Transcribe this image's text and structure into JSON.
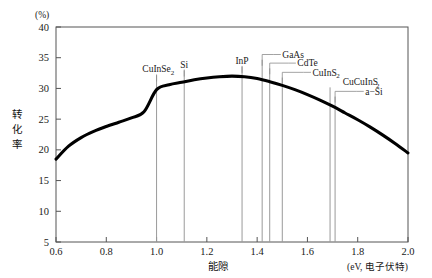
{
  "figure": {
    "y_unit_label": "(%)",
    "x_axis_title": "能隙",
    "x_unit_label": "(eV, 电子伏特)",
    "y_axis_title_chars": [
      "转",
      "化",
      "率"
    ],
    "caption": ""
  },
  "chart_data": {
    "type": "line",
    "title": "",
    "xlabel": "能隙",
    "ylabel": "转化率",
    "x_unit": "(eV, 电子伏特)",
    "y_unit": "(%)",
    "xlim": [
      0.6,
      2.0
    ],
    "ylim": [
      5,
      40
    ],
    "grid": false,
    "legend": "none",
    "x_ticks": [
      "0.6",
      "0.8",
      "1.0",
      "1.2",
      "1.4",
      "1.6",
      "1.8",
      "2.0"
    ],
    "x_tick_values": [
      0.6,
      0.8,
      1.0,
      1.2,
      1.4,
      1.6,
      1.8,
      2.0
    ],
    "y_ticks": [
      "5",
      "10",
      "15",
      "20",
      "25",
      "30",
      "35",
      "40"
    ],
    "y_tick_values": [
      5,
      10,
      15,
      20,
      25,
      30,
      35,
      40
    ],
    "series": [
      {
        "name": "理论转化率上限",
        "x": [
          0.6,
          0.65,
          0.7,
          0.75,
          0.8,
          0.85,
          0.9,
          0.95,
          1.0,
          1.05,
          1.1,
          1.15,
          1.2,
          1.25,
          1.3,
          1.35,
          1.4,
          1.45,
          1.5,
          1.55,
          1.6,
          1.65,
          1.7,
          1.75,
          1.8,
          1.85,
          1.9,
          1.95,
          2.0
        ],
        "y": [
          18.5,
          20.6,
          22.0,
          23.0,
          23.8,
          24.5,
          25.2,
          26.2,
          29.8,
          30.6,
          31.0,
          31.4,
          31.7,
          31.9,
          32.0,
          31.9,
          31.6,
          31.1,
          30.5,
          29.8,
          29.0,
          28.1,
          27.1,
          26.0,
          24.9,
          23.7,
          22.4,
          21.0,
          19.5
        ]
      }
    ],
    "markers": [
      {
        "id": "cuinse2",
        "label": "CuInSe",
        "sub": "2",
        "x": 1.0,
        "label_x": 1.0,
        "label_y": 32.6,
        "leader": "vertical"
      },
      {
        "id": "si",
        "label": "Si",
        "sub": "",
        "x": 1.11,
        "label_x": 1.11,
        "label_y": 33.4,
        "leader": "vertical"
      },
      {
        "id": "inp",
        "label": "InP",
        "sub": "",
        "x": 1.34,
        "label_x": 1.34,
        "label_y": 34.0,
        "leader": "vertical"
      },
      {
        "id": "gaas",
        "label": "GaAs",
        "sub": "",
        "x": 1.42,
        "label_x": 1.5,
        "label_y": 35.0,
        "leader": "elbow"
      },
      {
        "id": "cdte",
        "label": "CdTe",
        "sub": "",
        "x": 1.45,
        "label_x": 1.56,
        "label_y": 33.6,
        "leader": "elbow"
      },
      {
        "id": "cuins2",
        "label": "CuInS",
        "sub": "2",
        "x": 1.5,
        "label_x": 1.62,
        "label_y": 32.1,
        "leader": "elbow"
      },
      {
        "id": "cucuins2",
        "label": "CuCuInS",
        "sub": "2",
        "x": 1.69,
        "label_x": 1.74,
        "label_y": 30.5,
        "leader": "none"
      },
      {
        "id": "asi",
        "label": "a−Si",
        "sub": "",
        "x": 1.71,
        "label_x": 1.83,
        "label_y": 29.0,
        "leader": "elbow"
      }
    ]
  }
}
